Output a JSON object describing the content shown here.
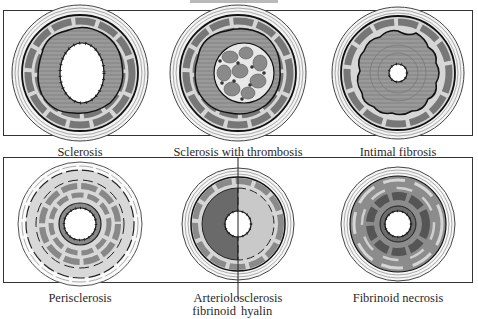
{
  "figure": {
    "top_bar": "gray-bar",
    "panels": [
      {
        "id": "sclerosis",
        "label": "Sclerosis",
        "row": 1,
        "col": 1
      },
      {
        "id": "sclerosis-with-thrombosis",
        "label": "Sclerosis with thrombosis",
        "row": 1,
        "col": 2
      },
      {
        "id": "intimal-fibrosis",
        "label": "Intimal fibrosis",
        "row": 1,
        "col": 3
      },
      {
        "id": "perisclerosis",
        "label": "Perisclerosis",
        "row": 2,
        "col": 1
      },
      {
        "id": "arteriolosclerosis",
        "label": "Arteriolosclerosis",
        "sublabel_left": "fibrinoid",
        "sublabel_right": "hyalin",
        "row": 2,
        "col": 2
      },
      {
        "id": "fibrinoid-necrosis",
        "label": "Fibrinoid necrosis",
        "row": 2,
        "col": 3
      }
    ]
  },
  "colors": {
    "outline": "#222222",
    "media_dark": "#7d7d7d",
    "media_light": "#cfcfcf",
    "intima": "#8f8f8f",
    "thrombus": "#8a8a8a",
    "fibrinoid": "#5c5c5c",
    "hyalin": "#c8c8c8",
    "background": "#ffffff"
  }
}
